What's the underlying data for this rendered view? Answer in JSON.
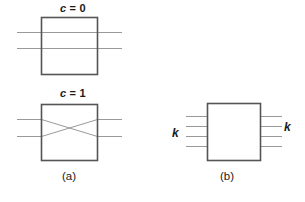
{
  "figure": {
    "background_color": "#ffffff",
    "box_stroke_color": "#555555",
    "wire_stroke_color": "#999999",
    "text_color": "#1a1a1a"
  },
  "panel_a": {
    "caption": "(a)",
    "state_straight": {
      "control_label_var": "c",
      "control_label_eq": " = ",
      "control_label_value": "0",
      "wire_count": 2,
      "routing": "straight"
    },
    "state_crossed": {
      "control_label_var": "c",
      "control_label_eq": " = ",
      "control_label_value": "1",
      "wire_count": 2,
      "routing": "crossed"
    }
  },
  "panel_b": {
    "caption": "(b)",
    "input_label": "k",
    "output_label": "k",
    "input_wire_count": 4,
    "output_wire_count": 4
  }
}
